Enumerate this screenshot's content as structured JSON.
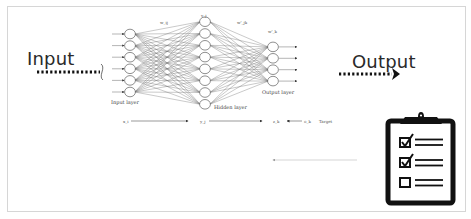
{
  "diagram": {
    "input_label": "Input",
    "output_label": "Output",
    "network": {
      "layers": [
        {
          "name": "Input layer",
          "node_count": 6
        },
        {
          "name": "Hidden layer",
          "node_count": 8
        },
        {
          "name": "Output layer",
          "node_count": 4
        }
      ],
      "weight_labels": {
        "input_hidden": "w_ij",
        "hidden_top": "v_j",
        "hidden_output": "w'_jk",
        "output_top": "w'_k"
      },
      "flow_labels": {
        "input_var": "x_i",
        "hidden_var": "y_j",
        "output_var": "z_k",
        "target_var": "o_k",
        "target_text": "Target"
      }
    },
    "checklist_icon": {
      "name": "clipboard-checklist-icon",
      "items": [
        {
          "checked": true
        },
        {
          "checked": true
        },
        {
          "checked": false
        }
      ]
    },
    "colors": {
      "text": "#2a2a2a",
      "frame_border": "#d6d6d6",
      "network_lines": "#555555",
      "icon": "#111111"
    }
  }
}
